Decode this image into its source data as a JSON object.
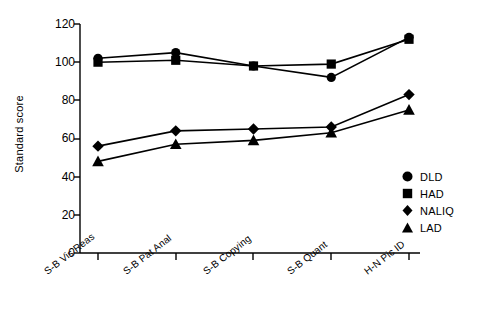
{
  "chart_data": {
    "type": "line",
    "title": "",
    "xlabel": "",
    "ylabel": "Standard score",
    "categories": [
      "S-B Vis Reas",
      "S-B Pat Anal",
      "S-B Copying",
      "S-B Quant",
      "H-N Pic ID"
    ],
    "ylim": [
      0,
      120
    ],
    "yticks": [
      0,
      20,
      40,
      60,
      80,
      100,
      120
    ],
    "grid": false,
    "legend_position": "right",
    "series": [
      {
        "name": "DLD",
        "marker": "circle",
        "color": "#000000",
        "values": [
          102,
          105,
          98,
          92,
          113
        ]
      },
      {
        "name": "HAD",
        "marker": "square",
        "color": "#000000",
        "values": [
          100,
          101,
          98,
          99,
          112
        ]
      },
      {
        "name": "NALIQ",
        "marker": "diamond",
        "color": "#000000",
        "values": [
          56,
          64,
          65,
          66,
          83
        ]
      },
      {
        "name": "LAD",
        "marker": "triangle",
        "color": "#000000",
        "values": [
          48,
          57,
          59,
          63,
          75
        ]
      }
    ]
  },
  "axis": {
    "y_title": "Standard score",
    "y_tick_labels": [
      "120",
      "100",
      "80",
      "60",
      "40",
      "20",
      "0"
    ],
    "x_tick_labels": [
      "S-B Vis Reas",
      "S-B Pat Anal",
      "S-B Copying",
      "S-B Quant",
      "H-N Pic ID"
    ]
  },
  "legend": {
    "items": [
      {
        "label": "DLD",
        "marker": "circle-marker-icon"
      },
      {
        "label": "HAD",
        "marker": "square-marker-icon"
      },
      {
        "label": "NALIQ",
        "marker": "diamond-marker-icon"
      },
      {
        "label": "LAD",
        "marker": "triangle-marker-icon"
      }
    ]
  }
}
